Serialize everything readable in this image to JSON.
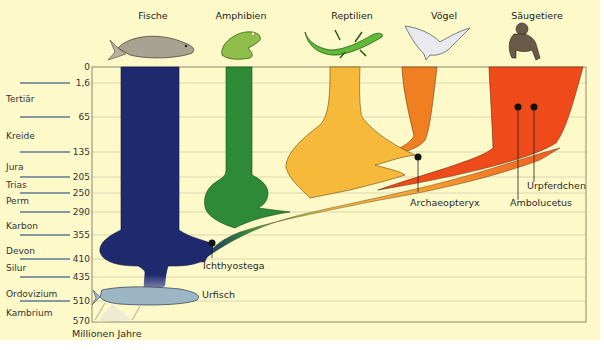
{
  "headers": [
    {
      "label": "Fische",
      "icon": "fish-icon"
    },
    {
      "label": "Amphibien",
      "icon": "frog-icon"
    },
    {
      "label": "Reptilien",
      "icon": "lizard-icon"
    },
    {
      "label": "Vögel",
      "icon": "bird-icon"
    },
    {
      "label": "Säugetiere",
      "icon": "ape-icon"
    }
  ],
  "time_axis": {
    "unit_label": "Millionen Jahre",
    "ticks": [
      "0",
      "1,6",
      "65",
      "135",
      "205",
      "250",
      "290",
      "355",
      "410",
      "435",
      "510",
      "570"
    ]
  },
  "eras": [
    "Tertiär",
    "Kreide",
    "Jura",
    "Trias",
    "Perm",
    "Karbon",
    "Devon",
    "Silur",
    "Ordovizium",
    "Kambrium"
  ],
  "annotations": {
    "ichthyostega": "Ichthyostega",
    "urfisch": "Urfisch",
    "archaeopteryx": "Archaeopteryx",
    "ambolucetus": "Ambolucetus",
    "urpferdchen": "Urpferdchen"
  },
  "colors": {
    "background": "#fdf9c9",
    "fish": "#1f2a6e",
    "amphibians": "#2e8a36",
    "reptiles": "#f6b93a",
    "birds": "#f07f22",
    "mammals": "#ee4a1a",
    "grid": "#c9c9a8"
  }
}
